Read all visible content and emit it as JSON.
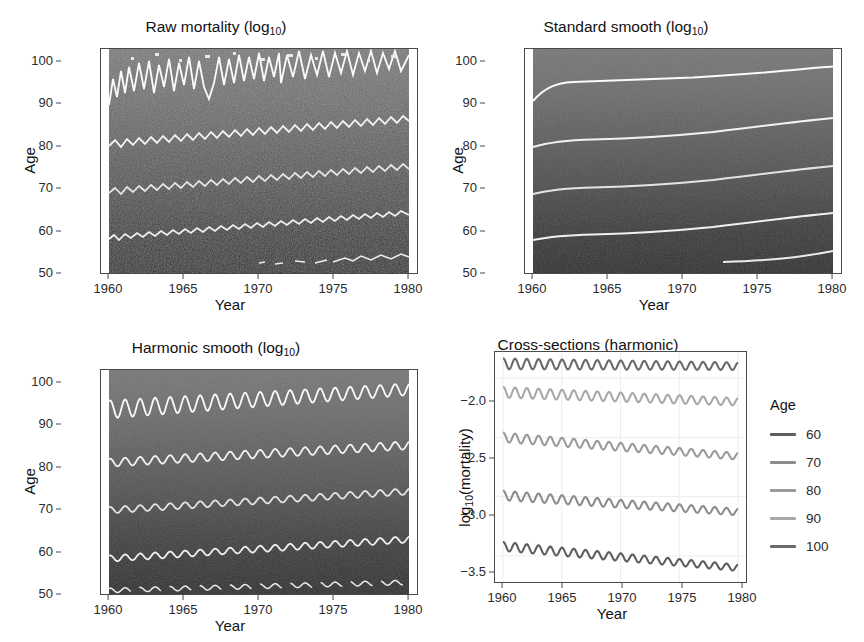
{
  "figure": {
    "width": 864,
    "height": 642,
    "background": "#ffffff"
  },
  "panels": [
    {
      "id": "raw-mortality",
      "title_main": "Raw mortality (log",
      "title_sub": "10",
      "title_tail": ")",
      "title_full": "Raw mortality (log10)",
      "xlabel": "Year",
      "ylabel": "Age",
      "xticks": [
        "1960",
        "1965",
        "1970",
        "1975",
        "1980"
      ],
      "yticks": [
        "50",
        "60",
        "70",
        "80",
        "90",
        "100"
      ]
    },
    {
      "id": "standard-smooth",
      "title_main": "Standard smooth (log",
      "title_sub": "10",
      "title_tail": ")",
      "title_full": "Standard smooth (log10)",
      "xlabel": "Year",
      "ylabel": "Age",
      "xticks": [
        "1960",
        "1965",
        "1970",
        "1975",
        "1980"
      ],
      "yticks": [
        "50",
        "60",
        "70",
        "80",
        "90",
        "100"
      ]
    },
    {
      "id": "harmonic-smooth",
      "title_main": "Harmonic smooth (log",
      "title_sub": "10",
      "title_tail": ")",
      "title_full": "Harmonic smooth (log10)",
      "xlabel": "Year",
      "ylabel": "Age",
      "xticks": [
        "1960",
        "1965",
        "1970",
        "1975",
        "1980"
      ],
      "yticks": [
        "50",
        "60",
        "70",
        "80",
        "90",
        "100"
      ]
    },
    {
      "id": "cross-sections",
      "title_full": "Cross-sections (harmonic)",
      "xlabel": "Year",
      "ylabel_main": "log",
      "ylabel_sub": "10",
      "ylabel_tail": "(mortality)",
      "ylabel_full": "log10(mortality)",
      "xticks": [
        "1960",
        "1965",
        "1970",
        "1975",
        "1980"
      ],
      "yticks": [
        "−2.0",
        "−2.5",
        "−3.0",
        "−3.5"
      ]
    }
  ],
  "legend": {
    "title": "Age",
    "items": [
      {
        "label": "60",
        "color": "#5e5e5e"
      },
      {
        "label": "70",
        "color": "#8c8c8c"
      },
      {
        "label": "80",
        "color": "#9a9a9a"
      },
      {
        "label": "90",
        "color": "#a8a8a8"
      },
      {
        "label": "100",
        "color": "#6a6a6a"
      }
    ]
  },
  "chart_data": [
    {
      "id": "raw-mortality",
      "type": "heatmap",
      "title": "Raw mortality (log10)",
      "xlabel": "Year",
      "ylabel": "Age",
      "xlim": [
        1960,
        1980
      ],
      "ylim": [
        50,
        100
      ],
      "xticks": [
        1960,
        1965,
        1970,
        1975,
        1980
      ],
      "yticks": [
        50,
        60,
        70,
        80,
        90,
        100
      ],
      "grid": false,
      "legend_position": "none",
      "value_variable": "log10(mortality)",
      "value_range": [
        -3.7,
        -1.8
      ],
      "colormap": "greyscale: dark = low mortality (young), light = high mortality (old)",
      "noise": "high (raw monthly counts, speckled)",
      "contours": [
        {
          "age_level": 60,
          "note": "ragged noisy contour rising slowly from ~58 to ~62"
        },
        {
          "age_level": 70,
          "note": "ragged noisy contour rising slowly from ~68 to ~73"
        },
        {
          "age_level": 80,
          "note": "ragged noisy contour rising slowly from ~79 to ~83"
        },
        {
          "age_level": 90,
          "note": "very noisy large-amplitude contour oscillating ~90 to ~97"
        },
        {
          "age_level": 100,
          "note": "speckled fragments near top edge"
        }
      ]
    },
    {
      "id": "standard-smooth",
      "type": "heatmap",
      "title": "Standard smooth (log10)",
      "xlabel": "Year",
      "ylabel": "Age",
      "xlim": [
        1960,
        1980
      ],
      "ylim": [
        50,
        100
      ],
      "xticks": [
        1960,
        1965,
        1970,
        1975,
        1980
      ],
      "yticks": [
        50,
        60,
        70,
        80,
        90,
        100
      ],
      "grid": false,
      "legend_position": "none",
      "value_variable": "log10(mortality)",
      "value_range": [
        -3.7,
        -1.8
      ],
      "colormap": "greyscale: dark = low mortality (young), light = high mortality (old)",
      "noise": "none (smoothed surface)",
      "contours": [
        {
          "age_level": 60,
          "start_age": 57.8,
          "end_age": 62.2
        },
        {
          "age_level": 70,
          "start_age": 68.8,
          "end_age": 72.9
        },
        {
          "age_level": 80,
          "start_age": 79.5,
          "end_age": 83.3
        },
        {
          "age_level": 90,
          "start_age": 91.0,
          "end_age": 95.6
        },
        {
          "age_level": 100,
          "start_age": 50.6,
          "end_age": 53.0
        }
      ]
    },
    {
      "id": "harmonic-smooth",
      "type": "heatmap",
      "title": "Harmonic smooth (log10)",
      "xlabel": "Year",
      "ylabel": "Age",
      "xlim": [
        1960,
        1980
      ],
      "ylim": [
        50,
        100
      ],
      "xticks": [
        1960,
        1965,
        1970,
        1975,
        1980
      ],
      "yticks": [
        50,
        60,
        70,
        80,
        90,
        100
      ],
      "grid": false,
      "legend_position": "none",
      "value_variable": "log10(mortality)",
      "value_range": [
        -3.7,
        -1.8
      ],
      "colormap": "greyscale: dark = low mortality (young), light = high mortality (old)",
      "noise": "none (smoothed surface with annual seasonal harmonic)",
      "seasonal_cycles_per_year": 1,
      "contours": [
        {
          "age_level": 60,
          "start_age": 57.9,
          "end_age": 62.2,
          "amplitude": 0.7
        },
        {
          "age_level": 70,
          "start_age": 68.7,
          "end_age": 72.9,
          "amplitude": 0.7
        },
        {
          "age_level": 80,
          "start_age": 79.3,
          "end_age": 83.2,
          "amplitude": 0.9
        },
        {
          "age_level": 90,
          "start_age": 91.2,
          "end_age": 95.7,
          "amplitude": 2.0
        },
        {
          "age_level": 100,
          "start_age": 50.8,
          "end_age": 52.6,
          "amplitude": 0.5
        }
      ]
    },
    {
      "id": "cross-sections",
      "type": "line",
      "title": "Cross-sections (harmonic)",
      "xlabel": "Year",
      "ylabel": "log10(mortality)",
      "xlim": [
        1960,
        1980
      ],
      "ylim": [
        -3.72,
        -1.78
      ],
      "xticks": [
        1960,
        1965,
        1970,
        1975,
        1980
      ],
      "yticks": [
        -2.0,
        -2.5,
        -3.0,
        -3.5
      ],
      "grid": true,
      "legend_position": "right",
      "legend_title": "Age",
      "seasonal_cycles_per_year": 1,
      "series": [
        {
          "name": "100",
          "color": "#6a6a6a",
          "start_value": -1.88,
          "end_value": -1.9,
          "amplitude": 0.045,
          "trend": "essentially flat"
        },
        {
          "name": "90",
          "color": "#a8a8a8",
          "start_value": -2.12,
          "end_value": -2.2,
          "amplitude": 0.045,
          "trend": "slight decline"
        },
        {
          "name": "80",
          "color": "#9a9a9a",
          "start_value": -2.5,
          "end_value": -2.66,
          "amplitude": 0.04,
          "trend": "moderate decline"
        },
        {
          "name": "70",
          "color": "#8c8c8c",
          "start_value": -2.99,
          "end_value": -3.13,
          "amplitude": 0.04,
          "trend": "moderate decline"
        },
        {
          "name": "60",
          "color": "#5e5e5e",
          "start_value": -3.42,
          "end_value": -3.6,
          "amplitude": 0.038,
          "trend": "moderate decline"
        }
      ]
    }
  ]
}
